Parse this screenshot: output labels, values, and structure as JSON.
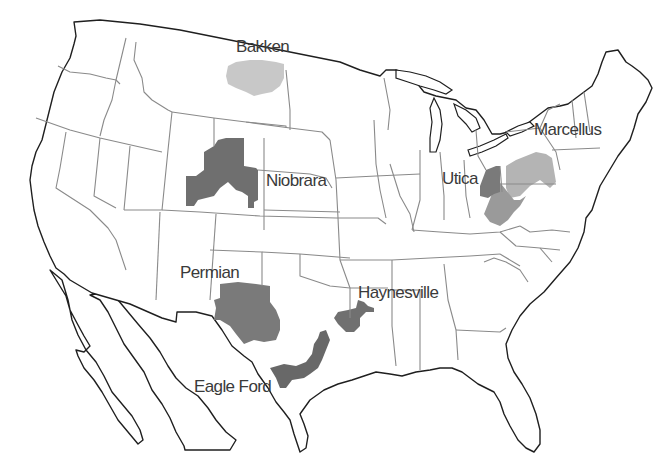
{
  "map": {
    "subject": "United States shale plays",
    "colors": {
      "background": "#ffffff",
      "land": "#ffffff",
      "coastline": "#1f1f1f",
      "state_border": "#8a8a8a",
      "label_text": "#3a3a3a",
      "light_shade": "#c8c8c8",
      "medium_shade": "#9a9a9a",
      "dark_shade": "#6f6f6f"
    },
    "plays": [
      {
        "name": "Bakken",
        "shade": "light"
      },
      {
        "name": "Niobrara",
        "shade": "dark"
      },
      {
        "name": "Marcellus",
        "shade": "medium"
      },
      {
        "name": "Utica",
        "shade": "dark"
      },
      {
        "name": "Permian",
        "shade": "dark"
      },
      {
        "name": "Haynesville",
        "shade": "dark"
      },
      {
        "name": "Eagle Ford",
        "shade": "dark"
      }
    ]
  }
}
